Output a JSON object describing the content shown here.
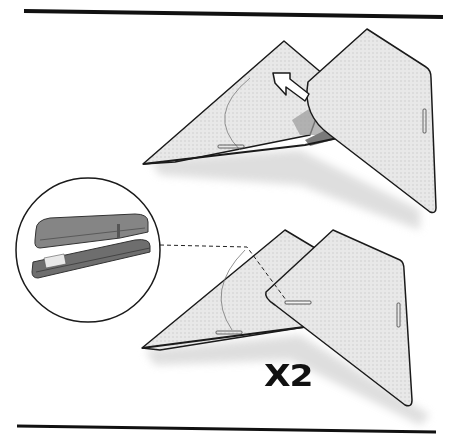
{
  "figure": {
    "type": "assembly-instruction-step",
    "steps": [
      {
        "id": "fold",
        "description": "Fold the right triangular panel over onto the left panel",
        "indicator": "arrow-pointing-up-left"
      },
      {
        "id": "staple",
        "description": "Staple the overlapping panels together",
        "tool": "stapler",
        "callout": "circle-magnifier-with-dashed-leader-line"
      }
    ],
    "multiplier_label": "X2",
    "colors": {
      "rule": "#111111",
      "outline": "#1a1a1a",
      "panel_fill": "#e6e6e6",
      "panel_shadow": "#d0d0d0",
      "stapler_body": "#7a7a7a",
      "stapler_dark": "#4a4a4a"
    }
  }
}
